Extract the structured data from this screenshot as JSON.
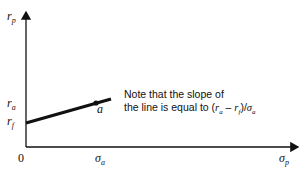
{
  "axes": {
    "y_label_base": "r",
    "y_label_sub": "p",
    "x_label_base": "σ",
    "x_label_sub": "p",
    "origin": "0"
  },
  "ticks": {
    "ra_base": "r",
    "ra_sub": "a",
    "rf_base": "r",
    "rf_sub": "f",
    "sigma_a_base": "σ",
    "sigma_a_sub": "a"
  },
  "point": {
    "label": "a"
  },
  "note": {
    "line1": "Note that the slope of",
    "line2_prefix": "the line is equal to (",
    "r": "r",
    "a": "a",
    "minus": " – ",
    "f": "f",
    "close_div": ")/",
    "sigma": "σ"
  },
  "colors": {
    "ink": "#111111",
    "background": "#ffffff"
  }
}
